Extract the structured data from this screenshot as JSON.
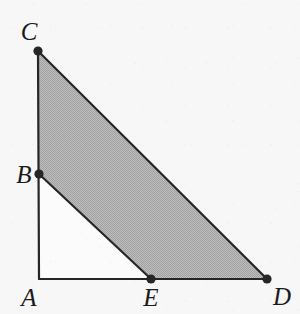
{
  "figure": {
    "background_color": "#f7f7f7",
    "stroke_color": "#262626",
    "shaded_fill_color": "#b4b4b4",
    "unshaded_fill_color": "#fbfbfb",
    "label_color": "#1b1b1b",
    "stroke_width": 2.2,
    "dot_radius": 4.6
  },
  "points": [
    {
      "id": "A",
      "label": "A",
      "x": 39,
      "y": 279,
      "dot_visible": false,
      "label_x": 29,
      "label_y": 297
    },
    {
      "id": "B",
      "label": "B",
      "x": 39,
      "y": 174,
      "dot_visible": true,
      "label_x": 24,
      "label_y": 174
    },
    {
      "id": "C",
      "label": "C",
      "x": 38,
      "y": 51,
      "dot_visible": true,
      "label_x": 29,
      "label_y": 31
    },
    {
      "id": "D",
      "label": "D",
      "x": 267,
      "y": 279,
      "dot_visible": true,
      "label_x": 282,
      "label_y": 296
    },
    {
      "id": "E",
      "label": "E",
      "x": 151,
      "y": 279,
      "dot_visible": true,
      "label_x": 151,
      "label_y": 297
    }
  ],
  "shaded_region": {
    "name": "BCDE",
    "polygon": "39,174 38,51 267,279 151,279"
  },
  "unshaded_region": {
    "name": "ABE",
    "polygon": "39,279 39,174 151,279"
  },
  "segments": [
    {
      "name": "AC",
      "x1": 39,
      "y1": 279,
      "x2": 38,
      "y2": 51
    },
    {
      "name": "AD",
      "x1": 39,
      "y1": 279,
      "x2": 267,
      "y2": 279
    },
    {
      "name": "CD",
      "x1": 38,
      "y1": 51,
      "x2": 267,
      "y2": 279
    },
    {
      "name": "BE",
      "x1": 39,
      "y1": 174,
      "x2": 151,
      "y2": 279
    }
  ]
}
